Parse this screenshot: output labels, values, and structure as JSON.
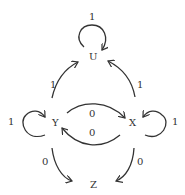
{
  "nodes": {
    "U": "U",
    "X": "X",
    "Y": "Y",
    "Z": "Z"
  },
  "edges": {
    "u_self": "1",
    "y_to_u": "1",
    "x_to_u": "1",
    "y_self": "1",
    "x_self": "1",
    "y_to_x": "0",
    "x_to_y": "0",
    "y_to_z": "0",
    "x_to_z": "0"
  },
  "colors": {
    "stroke": "#333333",
    "background": "#ffffff"
  }
}
